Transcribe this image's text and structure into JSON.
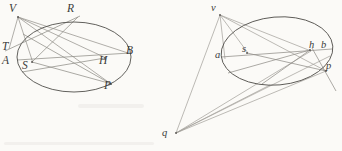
{
  "figure": {
    "background_color": "#fbfaf7",
    "ink_color": "#6e6c68",
    "label_color": "#3a3a3a",
    "ellipse_stroke": "#5a5854",
    "ray_stroke": "#8f8d87",
    "width": 342,
    "height": 151
  },
  "left_diagram": {
    "name": "left-ellipse-figure",
    "ellipse": {
      "cx": 74,
      "cy": 57,
      "rx": 57,
      "ry": 35,
      "rotation": 0
    },
    "labels": [
      {
        "id": "V",
        "text": "V",
        "x": 9,
        "y": 3,
        "size": "upper"
      },
      {
        "id": "R",
        "text": "R",
        "x": 67,
        "y": 3,
        "size": "upper"
      },
      {
        "id": "T",
        "text": "T",
        "x": 2,
        "y": 41,
        "size": "upper"
      },
      {
        "id": "A",
        "text": "A",
        "x": 2,
        "y": 55,
        "size": "upper"
      },
      {
        "id": "S",
        "text": "S",
        "x": 22,
        "y": 60,
        "size": "upper"
      },
      {
        "id": "H",
        "text": "H",
        "x": 99,
        "y": 55,
        "size": "upper"
      },
      {
        "id": "B",
        "text": "B",
        "x": 126,
        "y": 45,
        "size": "upper"
      },
      {
        "id": "P",
        "text": "P",
        "x": 104,
        "y": 80,
        "size": "upper"
      }
    ],
    "points": {
      "V": [
        18,
        17
      ],
      "R": [
        76,
        17
      ],
      "T": [
        10,
        48
      ],
      "A": [
        18,
        60
      ],
      "S": [
        32,
        62
      ],
      "H": [
        105,
        58
      ],
      "B": [
        128,
        53
      ],
      "P": [
        110,
        83
      ]
    }
  },
  "right_diagram": {
    "name": "right-ellipse-figure",
    "ellipse": {
      "cx": 277,
      "cy": 51,
      "rx": 56,
      "ry": 34,
      "rotation": -5
    },
    "labels": [
      {
        "id": "v",
        "text": "v",
        "x": 211,
        "y": 3,
        "size": "lower"
      },
      {
        "id": "a",
        "text": "a",
        "x": 215,
        "y": 50,
        "size": "lower"
      },
      {
        "id": "s",
        "text": "s",
        "x": 242,
        "y": 44,
        "size": "lower"
      },
      {
        "id": "h",
        "text": "h",
        "x": 309,
        "y": 40,
        "size": "lower"
      },
      {
        "id": "b",
        "text": "b",
        "x": 321,
        "y": 40,
        "size": "lower"
      },
      {
        "id": "p",
        "text": "p",
        "x": 326,
        "y": 61,
        "size": "lower"
      },
      {
        "id": "q",
        "text": "q",
        "x": 162,
        "y": 128,
        "size": "lower"
      }
    ],
    "points": {
      "v": [
        219,
        14
      ],
      "a": [
        224,
        58
      ],
      "s": [
        247,
        53
      ],
      "h": [
        310,
        50
      ],
      "b": [
        323,
        49
      ],
      "p": [
        325,
        70
      ],
      "q": [
        176,
        133
      ]
    }
  }
}
